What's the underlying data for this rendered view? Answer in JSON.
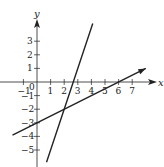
{
  "chart_data": {
    "type": "line",
    "title": "",
    "xlabel": "x",
    "ylabel": "y",
    "xlim": [
      -1.8,
      8.3
    ],
    "ylim": [
      -6,
      5.5
    ],
    "grid": false,
    "x_ticks": [
      -1,
      0,
      1,
      2,
      3,
      4,
      5,
      6,
      7
    ],
    "x_tick_labels": [
      "−1",
      "0",
      "1",
      "2",
      "3",
      "4",
      "5",
      "6",
      "7"
    ],
    "y_ticks": [
      3,
      2,
      1,
      -1,
      -2,
      -3,
      -4,
      -5
    ],
    "y_tick_labels": [
      "3",
      "2",
      "1",
      "−1",
      "−2",
      "−3",
      "−4",
      "−5"
    ],
    "series": [
      {
        "name": "steep line",
        "equation": "y = 3x - 8",
        "x": [
          0.7,
          4.1
        ],
        "y": [
          -5.9,
          4.3
        ]
      },
      {
        "name": "shallow line",
        "equation": "y = 0.5x - 3",
        "x": [
          -1.8,
          8.0
        ],
        "y": [
          -3.9,
          1.0
        ]
      }
    ],
    "intersection": {
      "x": 2,
      "y": -2
    }
  },
  "colors": {
    "axis": "#222222",
    "line": "#222222",
    "background": "#ffffff"
  }
}
